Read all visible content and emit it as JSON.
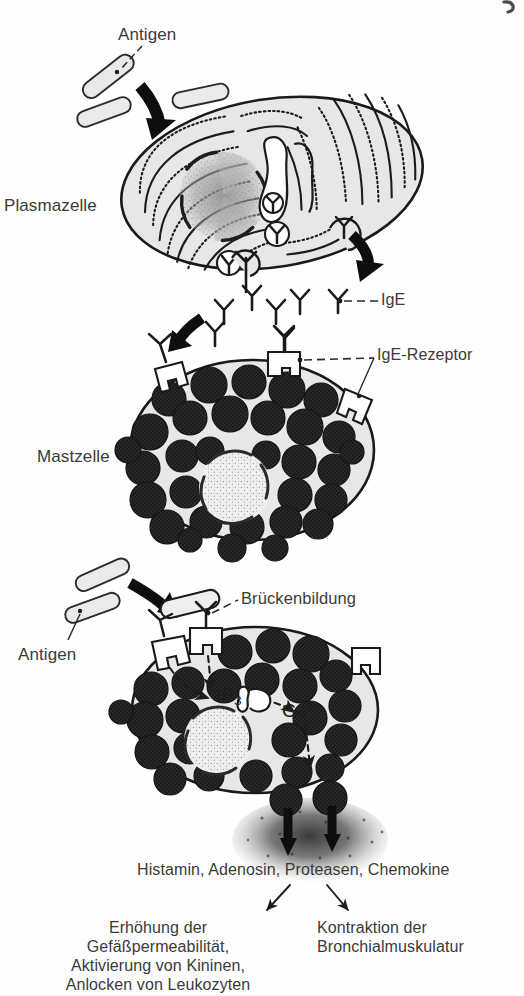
{
  "figure": {
    "kind": "biology-diagram",
    "background_color": "#ffffff",
    "ink_color": "#2e2e2e",
    "cell_fill_color": "#e8e8e8",
    "granule_color": "#1f1f1f",
    "arrow_color": "#111111"
  },
  "labels": {
    "antigen_top": "Antigen",
    "plasmazelle": "Plasmazelle",
    "ige": "IgE",
    "ige_rezeptor": "IgE-Rezeptor",
    "mastzelle": "Mastzelle",
    "brueckenbildung": "Brückenbildung",
    "antigen_bottom": "Antigen",
    "mediators": "Histamin, Adenosin, Proteasen, Chemokine",
    "effect_left": "Erhöhung der\nGefäßpermeabilität,\nAktivierung von Kininen,\nAnlocken von Leukozyten",
    "effect_right": "Kontraktion der\nBronchialmuskulatur"
  },
  "molecules": {
    "ip3_base": "IP",
    "ip3_sub": "3",
    "calcium_base": "Ca",
    "calcium_sup": "2+"
  },
  "stages": [
    {
      "id": "plasma-cell",
      "name": "Plasmazelle",
      "description": "Plasmazelle mit ausgeprägtem rauem endoplasmatischem Retikulum, die IgE-Antikörper produziert und sezerniert",
      "antigen_count": 3,
      "secreted_antibodies": 7
    },
    {
      "id": "mast-cell-sensitized",
      "name": "Mastzelle",
      "description": "Mastzelle mit IgE-Rezeptoren, an die sezernierte IgE-Antikörper binden; Zytoplasma voller dunkler Granula",
      "receptor_count": 3,
      "granule_count": 31
    },
    {
      "id": "mast-cell-activated",
      "name": "Brückenbildung und Degranulation",
      "description": "Antigen vernetzt zwei IgE-Rezeptor-Komplexe, löst IP3- und Ca2+-Signal aus und führt zur Freisetzung der Mediatoren",
      "receptor_count": 3,
      "granule_count": 24,
      "released_granules": 2
    }
  ]
}
